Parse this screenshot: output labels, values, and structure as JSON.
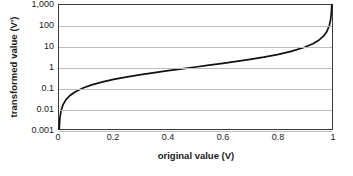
{
  "chart_data": {
    "type": "line",
    "title": "",
    "xlabel": "original value (V)",
    "ylabel": "transformed value (V')",
    "xlim": [
      0,
      1
    ],
    "ylim": [
      0.001,
      1000
    ],
    "yscale": "log",
    "xscale": "linear",
    "grid": true,
    "grid_axis": "y",
    "legend": "none",
    "xticks": [
      "0",
      "0.2",
      "0.4",
      "0.6",
      "0.8",
      "1"
    ],
    "xtick_values": [
      0,
      0.2,
      0.4,
      0.6,
      0.8,
      1
    ],
    "yticks": [
      "0.001",
      "0.01",
      "0.1",
      "1",
      "10",
      "100",
      "1,000"
    ],
    "ytick_values": [
      0.001,
      0.01,
      0.1,
      1,
      10,
      100,
      1000
    ],
    "series": [
      {
        "name": "odds transformation",
        "formula": "V' = V / (1 - V)",
        "color": "#111111",
        "x": [
          0.001,
          0.002,
          0.004,
          0.008,
          0.015,
          0.025,
          0.04,
          0.06,
          0.09,
          0.12,
          0.16,
          0.2,
          0.25,
          0.3,
          0.35,
          0.4,
          0.45,
          0.5,
          0.55,
          0.6,
          0.65,
          0.7,
          0.75,
          0.8,
          0.85,
          0.9,
          0.93,
          0.95,
          0.97,
          0.98,
          0.99,
          0.995,
          0.998,
          0.999
        ],
        "y": [
          0.001,
          0.002,
          0.004,
          0.0081,
          0.0152,
          0.0256,
          0.0417,
          0.0638,
          0.0989,
          0.1364,
          0.1905,
          0.25,
          0.3333,
          0.4286,
          0.5385,
          0.6667,
          0.8182,
          1.0,
          1.2222,
          1.5,
          1.8571,
          2.3333,
          3.0,
          4.0,
          5.6667,
          9.0,
          13.2857,
          19.0,
          32.3333,
          49.0,
          99.0,
          199.0,
          499.0,
          999.0
        ]
      }
    ],
    "annotations": []
  },
  "axis": {
    "ylabel": "transformed value (V')",
    "xlabel": "original value (V)"
  },
  "style": {
    "background": "#ffffff",
    "grid_color": "#bcbcbc",
    "frame_color": "#3a3a3a",
    "curve_color": "#111111",
    "text_color": "#1a1a1a"
  }
}
